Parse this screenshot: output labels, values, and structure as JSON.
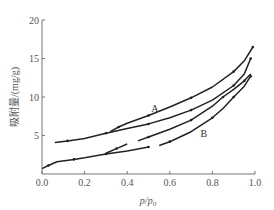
{
  "chart_data": {
    "type": "line",
    "title": "",
    "xlabel": "p/p0",
    "ylabel": "吸附量/(mg/g)",
    "xlim": [
      0.0,
      1.0
    ],
    "ylim": [
      0,
      20
    ],
    "xticks": [
      "0.0",
      "0.2",
      "0.4",
      "0.6",
      "0.8",
      "1.0"
    ],
    "yticks": [
      "5",
      "10",
      "15",
      "20"
    ],
    "grid": false,
    "legend": null,
    "annotations": [
      {
        "text": "A",
        "x": 0.53,
        "y": 8.1
      },
      {
        "text": "B",
        "x": 0.76,
        "y": 4.8
      }
    ],
    "series": [
      {
        "name": "A-adsorption",
        "segments": [
          [
            [
              0.06,
              4.1
            ],
            [
              0.12,
              4.3
            ],
            [
              0.2,
              4.6
            ],
            [
              0.3,
              5.3
            ],
            [
              0.4,
              5.9
            ],
            [
              0.5,
              6.5
            ],
            [
              0.6,
              7.3
            ],
            [
              0.7,
              8.3
            ],
            [
              0.8,
              9.6
            ],
            [
              0.9,
              11.5
            ],
            [
              0.95,
              13.0
            ],
            [
              0.98,
              15.0
            ]
          ]
        ]
      },
      {
        "name": "A-desorption",
        "segments": [
          [
            [
              0.32,
              5.5
            ],
            [
              0.36,
              6.1
            ],
            [
              0.4,
              6.6
            ],
            [
              0.5,
              7.6
            ],
            [
              0.6,
              8.7
            ],
            [
              0.7,
              9.9
            ],
            [
              0.8,
              11.3
            ],
            [
              0.9,
              13.3
            ],
            [
              0.95,
              14.7
            ],
            [
              0.99,
              16.5
            ]
          ]
        ]
      },
      {
        "name": "B-adsorption",
        "segments": [
          [
            [
              0.0,
              0.7
            ],
            [
              0.03,
              1.1
            ],
            [
              0.07,
              1.6
            ],
            [
              0.15,
              1.9
            ],
            [
              0.2,
              2.1
            ],
            [
              0.3,
              2.6
            ],
            [
              0.4,
              3.0
            ],
            [
              0.5,
              3.5
            ]
          ],
          [
            [
              0.55,
              3.7
            ],
            [
              0.6,
              4.2
            ],
            [
              0.7,
              5.5
            ],
            [
              0.8,
              7.3
            ],
            [
              0.85,
              8.5
            ],
            [
              0.9,
              10.0
            ],
            [
              0.95,
              11.4
            ],
            [
              0.98,
              12.7
            ]
          ]
        ]
      },
      {
        "name": "B-desorption",
        "segments": [
          [
            [
              0.3,
              2.7
            ],
            [
              0.35,
              3.3
            ],
            [
              0.4,
              3.9
            ]
          ],
          [
            [
              0.45,
              4.3
            ],
            [
              0.5,
              4.8
            ],
            [
              0.6,
              5.8
            ],
            [
              0.7,
              7.0
            ],
            [
              0.8,
              8.8
            ],
            [
              0.85,
              10.0
            ],
            [
              0.9,
              11.0
            ],
            [
              0.95,
              12.1
            ],
            [
              0.98,
              13.0
            ]
          ]
        ]
      }
    ]
  },
  "colors": {
    "line": "#222222",
    "axis": "#777777",
    "text": "#555555"
  }
}
